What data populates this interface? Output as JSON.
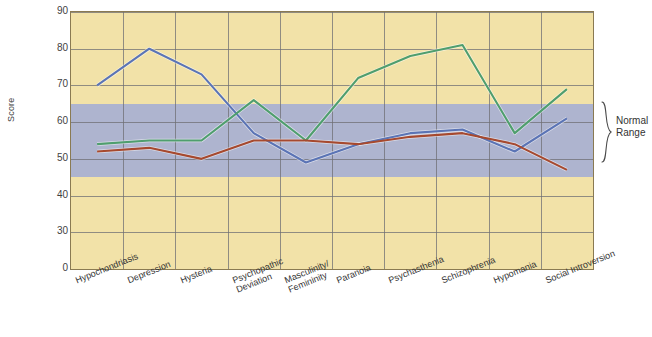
{
  "chart_data": {
    "type": "line",
    "title": "",
    "xlabel": "",
    "ylabel": "Score",
    "ylim": [
      20,
      90
    ],
    "yticks": [
      90,
      80,
      70,
      60,
      50,
      40,
      30,
      0
    ],
    "ytick_note": "axis is broken between 30 and 0",
    "grid": true,
    "legend": "none",
    "categories": [
      "Hypochondriasis",
      "Depression",
      "Hysteria",
      "Psychopathic Deviation",
      "Masculinity/ Femininity",
      "Paranoia",
      "Psychasthenia",
      "Schizophrenia",
      "Hypomania",
      "Social Introversion"
    ],
    "series": [
      {
        "name": "profile-blue",
        "color": "#5b74b5",
        "values": [
          70,
          80,
          73,
          57,
          49,
          54,
          57,
          58,
          52,
          61
        ]
      },
      {
        "name": "profile-green",
        "color": "#4f9e6e",
        "values": [
          54,
          55,
          55,
          66,
          55,
          72,
          78,
          81,
          57,
          69
        ]
      },
      {
        "name": "profile-red",
        "color": "#a6492f",
        "values": [
          52,
          53,
          50,
          55,
          55,
          54,
          56,
          57,
          54,
          47
        ]
      }
    ],
    "bands": [
      {
        "name": "normal-range",
        "label": "Normal Range",
        "from": 45,
        "to": 65,
        "color": "#aeb4cf"
      }
    ],
    "colors": {
      "plot_background": "#f2e2a8",
      "band_background": "#aeb4cf",
      "gridline": "#6f6f74",
      "axis": "#8a7a52"
    }
  },
  "annotation": {
    "normal_range_line1": "Normal",
    "normal_range_line2": "Range"
  }
}
